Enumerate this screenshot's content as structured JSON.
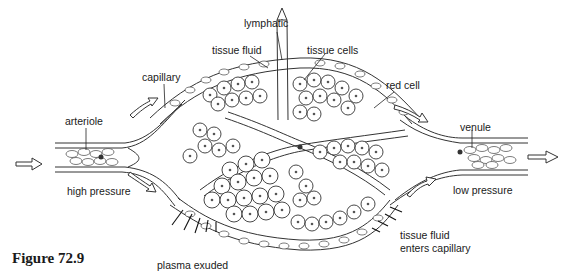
{
  "figure": {
    "caption": "Figure 72.9"
  },
  "labels": {
    "lymphatic": "lymphatic",
    "tissue_fluid_top": "tissue fluid",
    "tissue_cells": "tissue cells",
    "capillary": "capillary",
    "red_cell": "red cell",
    "arteriole": "arteriole",
    "venule": "venule",
    "high_pressure": "high pressure",
    "low_pressure": "low pressure",
    "tissue_fluid_enters_line1": "tissue fluid",
    "tissue_fluid_enters_line2": "enters capillary",
    "plasma_exuded": "plasma exuded"
  },
  "icons": {
    "flow_in": "hollow-arrow-right",
    "flow_out": "hollow-arrow-right",
    "lymph_flow": "hollow-arrow-up"
  }
}
